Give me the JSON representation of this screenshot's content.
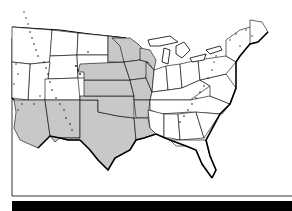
{
  "map": {
    "type": "outline-map",
    "region": "Contiguous United States (central and eastern, partial west)",
    "colors": {
      "background": "#ffffff",
      "state_fill": "#ffffff",
      "highlighted_fill": "#c8c8c8",
      "outline": "#000000",
      "mountain_stipple": "#111111",
      "bottom_bar": "#000000"
    },
    "highlighted_region": {
      "description": "Central plains and south-west states shaded gray",
      "approx_states": [
        "Arizona",
        "New Mexico",
        "Texas",
        "Oklahoma",
        "Kansas",
        "Nebraska",
        "eastern South Dakota",
        "eastern North Dakota",
        "Minnesota",
        "Iowa",
        "Missouri",
        "Wisconsin",
        "Arkansas",
        "Louisiana"
      ]
    },
    "stippled_features": [
      "Rocky Mountains",
      "Appalachian Mountains",
      "Sierra / Cascade ranges",
      "Adirondacks",
      "New England highlands"
    ],
    "labels": []
  }
}
